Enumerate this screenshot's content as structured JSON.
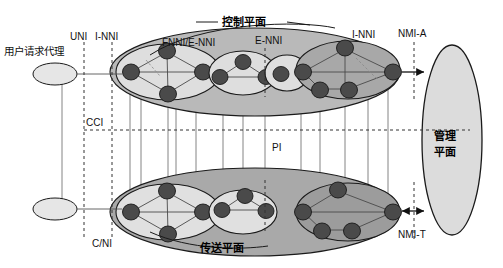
{
  "diagram": {
    "planes": {
      "control_plane_label": "控制平面",
      "transport_plane_label": "传送平面",
      "management_plane_label_line1": "管理",
      "management_plane_label_line2": "平面",
      "management_plane_label": "管理平面"
    },
    "actor": {
      "label": "用户请求代理"
    },
    "interfaces": {
      "uni": "UNI",
      "i_nni_left": "I-NNI",
      "fnni_e_nni": "FNNI/E-NNI",
      "e_nni": "E-NNI",
      "i_nni_right": "I-NNI",
      "nmi_a": "NMI-A",
      "nmi_t": "NMI-T",
      "cci": "CCI",
      "pi": "PI",
      "c_ni": "C/NI"
    },
    "colors": {
      "outer_plane_fill": "#b8b8b8",
      "inner_cluster_fill": "#d8d8d8",
      "light_cluster_fill": "#e8e8e8",
      "node_fill": "#4a4a4a",
      "management_fill": "#dcdcdc",
      "agent_fill": "#e4e4e4",
      "stroke": "#1a1a1a",
      "line": "#555555"
    }
  }
}
